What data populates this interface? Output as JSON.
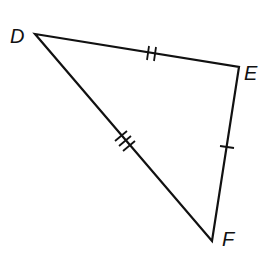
{
  "diagram": {
    "type": "triangle",
    "vertices": [
      {
        "label": "D",
        "x": 35,
        "y": 34
      },
      {
        "label": "E",
        "x": 239,
        "y": 67
      },
      {
        "label": "F",
        "x": 212,
        "y": 241
      }
    ],
    "sides": [
      {
        "name": "DE",
        "tick_marks": 2
      },
      {
        "name": "EF",
        "tick_marks": 1
      },
      {
        "name": "DF",
        "tick_marks": 3
      }
    ],
    "stroke_color": "#111111",
    "background": "#ffffff"
  }
}
